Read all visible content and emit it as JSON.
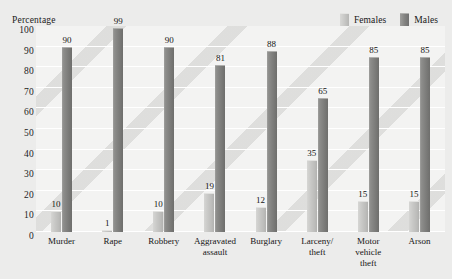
{
  "chart_data": {
    "type": "bar",
    "title": "",
    "xlabel": "",
    "ylabel": "Percentage",
    "ylim": [
      0,
      100
    ],
    "yticks": [
      0,
      10,
      20,
      30,
      40,
      50,
      60,
      70,
      80,
      90,
      100
    ],
    "grid": true,
    "legend_position": "top-right",
    "categories": [
      "Murder",
      "Rape",
      "Robbery",
      "Aggravated assault",
      "Burglary",
      "Larceny/ theft",
      "Motor vehicle theft",
      "Arson"
    ],
    "series": [
      {
        "name": "Females",
        "color": "#c6c6c4",
        "values": [
          10,
          1,
          10,
          19,
          12,
          35,
          15,
          15
        ]
      },
      {
        "name": "Males",
        "color": "#828280",
        "values": [
          90,
          99,
          90,
          81,
          88,
          65,
          85,
          85
        ]
      }
    ]
  },
  "legend": {
    "items": [
      {
        "label": "Females",
        "swatch": "female-swatch"
      },
      {
        "label": "Males",
        "swatch": "male-swatch"
      }
    ]
  }
}
